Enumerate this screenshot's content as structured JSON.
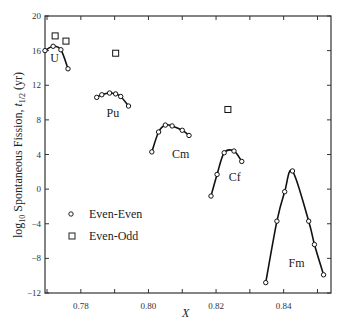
{
  "chart_data": {
    "type": "scatter",
    "title": "",
    "xlabel": "X",
    "ylabel": "log10 Spontaneous Fission, t1/2 (yr)",
    "xlim": [
      0.7694,
      0.854
    ],
    "ylim": [
      -12,
      20
    ],
    "x_ticks": [
      0.78,
      0.8,
      0.82,
      0.84
    ],
    "x_tick_labels": [
      "0.78",
      "0.80",
      "0.82",
      "0.84"
    ],
    "x_minor_ticks": [
      0.77,
      0.79,
      0.81,
      0.83,
      0.85
    ],
    "y_ticks": [
      -12,
      -8,
      -4,
      0,
      4,
      8,
      12,
      16,
      20
    ],
    "y_tick_labels": [
      "-12",
      "-8",
      "-4",
      "0",
      "4",
      "8",
      "12",
      "16",
      "20"
    ],
    "grid": false,
    "legend": {
      "position": "lower-left",
      "entries": [
        {
          "name": "Even-Even",
          "marker": "circle"
        },
        {
          "name": "Even-Odd",
          "marker": "square"
        }
      ]
    },
    "series": [
      {
        "name": "U",
        "kind": "Even-Even",
        "connected": true,
        "label_pos": [
          0.7722,
          14.7
        ],
        "x": [
          0.7694,
          0.7718,
          0.7741,
          0.7762
        ],
        "y": [
          16.0,
          16.5,
          16.1,
          13.9
        ]
      },
      {
        "name": "U",
        "kind": "Even-Odd",
        "connected": false,
        "x": [
          0.7724,
          0.7756
        ],
        "y": [
          17.7,
          17.1
        ]
      },
      {
        "name": "Pu",
        "kind": "Even-Even",
        "connected": true,
        "label_pos": [
          0.7895,
          8.3
        ],
        "x": [
          0.7847,
          0.7862,
          0.7885,
          0.7903,
          0.7918,
          0.7941
        ],
        "y": [
          10.6,
          10.9,
          11.1,
          11.0,
          10.7,
          9.6
        ]
      },
      {
        "name": "Pu",
        "kind": "Even-Odd",
        "connected": false,
        "x": [
          0.7903
        ],
        "y": [
          15.7
        ]
      },
      {
        "name": "Cm",
        "kind": "Even-Even",
        "connected": true,
        "label_pos": [
          0.8095,
          3.6
        ],
        "x": [
          0.801,
          0.803,
          0.805,
          0.807,
          0.81,
          0.812
        ],
        "y": [
          4.3,
          6.6,
          7.4,
          7.3,
          6.8,
          6.2
        ]
      },
      {
        "name": "Cf",
        "kind": "Even-Even",
        "connected": true,
        "label_pos": [
          0.8255,
          0.9
        ],
        "x": [
          0.8185,
          0.8203,
          0.8224,
          0.8253,
          0.8276
        ],
        "y": [
          -0.8,
          1.7,
          4.2,
          4.4,
          3.2
        ]
      },
      {
        "name": "Cf",
        "kind": "Even-Odd",
        "connected": false,
        "x": [
          0.8235
        ],
        "y": [
          9.2
        ]
      },
      {
        "name": "Fm",
        "kind": "Even-Even",
        "connected": true,
        "label_pos": [
          0.8438,
          -9.0
        ],
        "x": [
          0.8347,
          0.838,
          0.8403,
          0.8426,
          0.8474,
          0.8491,
          0.8518
        ],
        "y": [
          -10.8,
          -3.7,
          -0.3,
          2.1,
          -3.7,
          -6.4,
          -9.9
        ]
      }
    ]
  }
}
